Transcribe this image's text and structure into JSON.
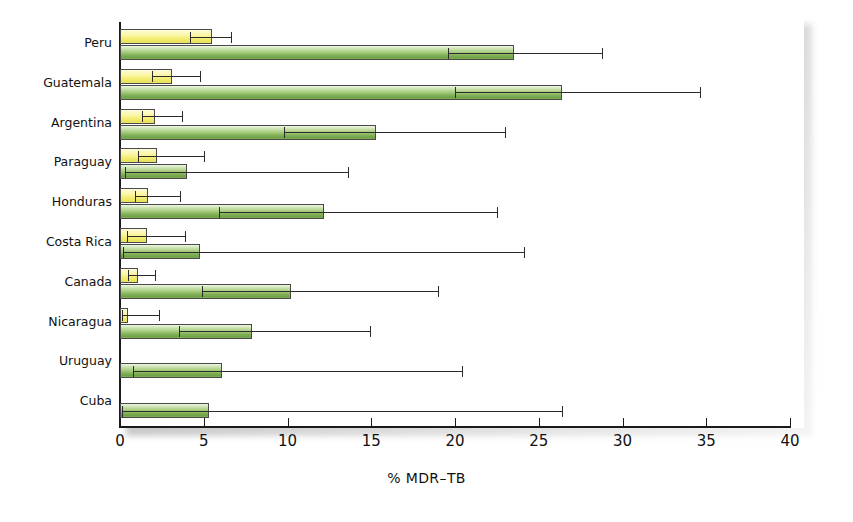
{
  "chart_data": {
    "type": "bar",
    "title": "",
    "xlabel": "% MDR–TB",
    "ylabel": "",
    "orientation": "horizontal",
    "xlim": [
      0,
      40
    ],
    "xticks": [
      0,
      5,
      10,
      15,
      20,
      25,
      30,
      35,
      40
    ],
    "xtick_labels": [
      "0",
      "5",
      "10",
      "15",
      "20",
      "25",
      "30",
      "35",
      "40"
    ],
    "grid": false,
    "legend": "none",
    "error_bars": "95% confidence interval",
    "categories": [
      "Peru",
      "Guatemala",
      "Argentina",
      "Paraguay",
      "Honduras",
      "Costa Rica",
      "Canada",
      "Nicaragua",
      "Uruguay",
      "Cuba"
    ],
    "series": [
      {
        "name": "new cases",
        "color": "#f5ef7c",
        "values": [
          5.5,
          3.1,
          2.1,
          2.2,
          1.7,
          1.6,
          1.1,
          0.5,
          null,
          null
        ],
        "ci_low": [
          4.2,
          1.9,
          1.3,
          1.1,
          0.9,
          0.4,
          0.5,
          0.1,
          null,
          null
        ],
        "ci_high": [
          6.6,
          4.8,
          3.7,
          5.0,
          3.6,
          3.9,
          2.1,
          2.3,
          null,
          null
        ]
      },
      {
        "name": "previously treated cases",
        "color": "#a6cc7e",
        "values": [
          23.5,
          26.4,
          15.3,
          4.0,
          12.2,
          4.8,
          10.2,
          7.9,
          6.1,
          5.3
        ],
        "ci_low": [
          19.6,
          20.0,
          9.8,
          0.3,
          5.9,
          0.2,
          4.9,
          3.5,
          0.8,
          0.1
        ],
        "ci_high": [
          28.8,
          34.6,
          23.0,
          13.6,
          22.5,
          24.1,
          19.0,
          14.9,
          20.4,
          26.4
        ]
      }
    ]
  }
}
